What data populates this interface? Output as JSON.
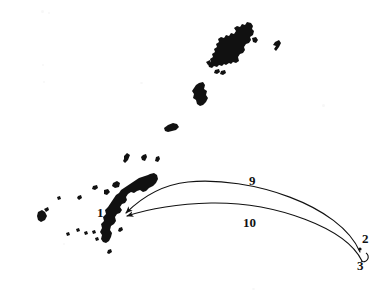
{
  "figure": {
    "background_color": "#ffffff",
    "ink_color": "#111111",
    "width": 389,
    "height": 303
  },
  "labels": [
    {
      "id": "point-1",
      "text": "1",
      "x": 97,
      "y": 213,
      "role": "site-marker"
    },
    {
      "id": "point-2",
      "text": "2",
      "x": 362,
      "y": 239,
      "role": "site-marker"
    },
    {
      "id": "point-3",
      "text": "3",
      "x": 357,
      "y": 266,
      "role": "site-marker"
    },
    {
      "id": "route-9",
      "text": "9",
      "x": 249,
      "y": 181,
      "role": "route-label"
    },
    {
      "id": "route-10",
      "text": "10",
      "x": 243,
      "y": 223,
      "role": "route-label"
    }
  ],
  "routes": [
    {
      "id": "route-9",
      "label": "9",
      "from_label": "2",
      "to_label": "1",
      "direction": "from 2 to 1",
      "style": "curved-arrow",
      "path": "M 360 252 C 340 205, 250 176, 188 182 C 160 185, 140 199, 126 213"
    },
    {
      "id": "route-10",
      "label": "10",
      "from_label": "3",
      "to_label": "1",
      "direction": "from 3 to 1",
      "style": "curved-arrow",
      "path": "M 362 261 C 346 228, 276 202, 211 203 C 176 204, 148 209, 127 216"
    }
  ],
  "markers": [
    {
      "id": "marker-dot-2",
      "shape": "dot",
      "x": 360,
      "y": 249,
      "r": 1.6
    },
    {
      "id": "marker-ring-3",
      "shape": "open-circle",
      "x": 363,
      "y": 257,
      "r": 3.4
    }
  ],
  "islands": [
    {
      "name": "amami-oshima",
      "group": "northern"
    },
    {
      "name": "kikai-jima",
      "group": "northern"
    },
    {
      "name": "amami-islets",
      "group": "northern"
    },
    {
      "name": "tokunoshima",
      "group": "central"
    },
    {
      "name": "okinoerabu-jima",
      "group": "central"
    },
    {
      "name": "yoron-jima",
      "group": "central"
    },
    {
      "name": "iheya-izena",
      "group": "okinawa"
    },
    {
      "name": "okinawa-main-island",
      "group": "okinawa"
    },
    {
      "name": "kume-jima",
      "group": "western"
    },
    {
      "name": "kerama-islets",
      "group": "western"
    }
  ]
}
